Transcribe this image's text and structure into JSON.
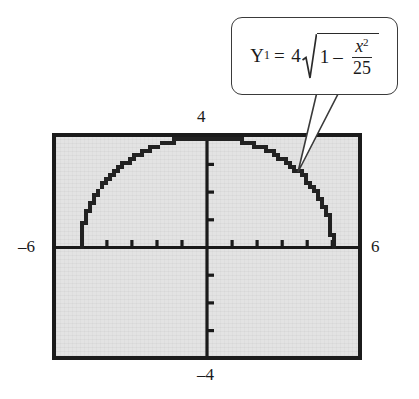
{
  "figure": {
    "colors": {
      "screen_background": "#e3e3e3",
      "frame_border": "#1b1b1b",
      "axis": "#1a1a1a",
      "curve": "#222222",
      "callout_border": "#3a3a3a",
      "callout_background": "#ffffff",
      "text": "#1a1a1a"
    }
  },
  "window_labels": {
    "ymax": "4",
    "ymin": "–4",
    "xmin": "–6",
    "xmax": "6"
  },
  "callout": {
    "lhs_var": "Y",
    "lhs_sub": "1",
    "equals": "=",
    "coefficient": "4",
    "radicand_one": "1",
    "minus": "–",
    "numerator_var": "x",
    "numerator_exp": "2",
    "denominator": "25",
    "equation_plain": "Y₁ = 4√(1 – x²/25)"
  },
  "chart_data": {
    "type": "line",
    "title": "",
    "xlabel": "",
    "ylabel": "",
    "xlim": [
      -6,
      6
    ],
    "ylim": [
      -4,
      4
    ],
    "grid": false,
    "legend": false,
    "x_tick_step": 1,
    "y_tick_step": 1,
    "x_ticks": [
      -5,
      -4,
      -3,
      -2,
      -1,
      1,
      2,
      3,
      4,
      5
    ],
    "y_ticks": [
      -3,
      -2,
      -1,
      1,
      2,
      3
    ],
    "series": [
      {
        "name": "Y1 = 4*sqrt(1 - x^2/25)",
        "style": "pixelated",
        "domain": [
          -5,
          5
        ],
        "x": [
          -5,
          -4.8,
          -4.6,
          -4.4,
          -4.2,
          -4,
          -3.8,
          -3.6,
          -3.4,
          -3.2,
          -3,
          -2.8,
          -2.6,
          -2.4,
          -2.2,
          -2,
          -1.8,
          -1.6,
          -1.4,
          -1.2,
          -1,
          -0.8,
          -0.6,
          -0.4,
          -0.2,
          0,
          0.2,
          0.4,
          0.6,
          0.8,
          1,
          1.2,
          1.4,
          1.6,
          1.8,
          2,
          2.2,
          2.4,
          2.6,
          2.8,
          3,
          3.2,
          3.4,
          3.6,
          3.8,
          4,
          4.2,
          4.4,
          4.6,
          4.8,
          5
        ],
        "values": [
          0,
          1.12,
          1.57,
          1.9,
          2.18,
          2.4,
          2.6,
          2.77,
          2.93,
          3.07,
          3.2,
          3.31,
          3.42,
          3.51,
          3.59,
          3.67,
          3.73,
          3.79,
          3.84,
          3.88,
          3.92,
          3.95,
          3.97,
          3.99,
          4,
          4,
          4,
          3.99,
          3.97,
          3.95,
          3.92,
          3.88,
          3.84,
          3.79,
          3.73,
          3.67,
          3.59,
          3.51,
          3.42,
          3.31,
          3.2,
          3.07,
          2.93,
          2.77,
          2.6,
          2.4,
          2.18,
          1.9,
          1.57,
          1.12,
          0
        ]
      }
    ],
    "annotations": [
      {
        "text": "Y₁ = 4√(1 – x²/25)",
        "points_to_x": 3.5,
        "points_to_y": 2.85
      }
    ]
  }
}
